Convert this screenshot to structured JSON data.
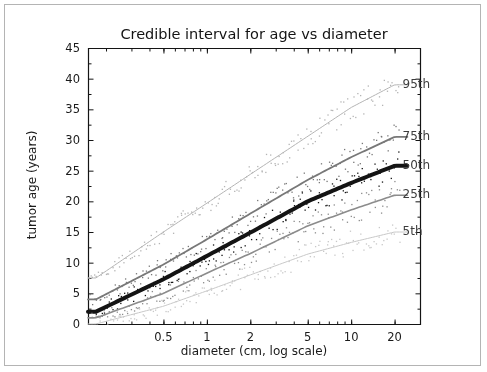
{
  "figure": {
    "title": "Credible interval for age vs diameter",
    "xlabel": "diameter (cm, log scale)",
    "ylabel": "tumor age (years)"
  },
  "chart_data": {
    "type": "line",
    "title": "Credible interval for age vs diameter",
    "xlabel": "diameter (cm, log scale)",
    "ylabel": "tumor age (years)",
    "xscale": "log",
    "yscale": "linear",
    "xlim": [
      0.15,
      30
    ],
    "ylim": [
      0,
      45
    ],
    "xticks": [
      0.5,
      1,
      2,
      5,
      10,
      20
    ],
    "xtick_labels": [
      "0.5",
      "1",
      "2",
      "5",
      "10",
      "20"
    ],
    "yticks": [
      0,
      5,
      10,
      15,
      20,
      25,
      30,
      35,
      40,
      45
    ],
    "ytick_labels": [
      "0",
      "5",
      "10",
      "15",
      "20",
      "25",
      "30",
      "35",
      "40",
      "45"
    ],
    "grid": false,
    "legend_position": "right-inline-annotations",
    "series": [
      {
        "name": "95th",
        "label": "95th",
        "color": "#b4b4b4",
        "linewidth": 1.0,
        "x": [
          0.17,
          0.5,
          1,
          2,
          5,
          10,
          20
        ],
        "values": [
          7.5,
          15.0,
          19.7,
          24.4,
          30.6,
          35.3,
          39.0
        ],
        "scatter": true
      },
      {
        "name": "75th",
        "label": "75th",
        "color": "#787878",
        "linewidth": 1.8,
        "x": [
          0.17,
          0.5,
          1,
          2,
          5,
          10,
          20
        ],
        "values": [
          4.0,
          9.7,
          13.8,
          18.0,
          23.5,
          27.2,
          30.5
        ],
        "scatter": true
      },
      {
        "name": "50th",
        "label": "50th",
        "color": "#141414",
        "linewidth": 4.0,
        "x": [
          0.17,
          0.5,
          1,
          2,
          5,
          10,
          20
        ],
        "values": [
          2.0,
          7.3,
          11.1,
          14.9,
          20.0,
          23.0,
          25.8
        ],
        "scatter": true
      },
      {
        "name": "25th",
        "label": "25th",
        "color": "#8c8c8c",
        "linewidth": 1.6,
        "x": [
          0.17,
          0.5,
          1,
          2,
          5,
          10,
          20
        ],
        "values": [
          1.0,
          5.0,
          8.3,
          11.5,
          16.0,
          18.6,
          21.0
        ],
        "scatter": true
      },
      {
        "name": "5th",
        "label": "5th",
        "color": "#c8c8c8",
        "linewidth": 1.0,
        "x": [
          0.17,
          0.5,
          1,
          2,
          5,
          10,
          20
        ],
        "values": [
          0.0,
          2.9,
          5.4,
          8.0,
          11.4,
          13.3,
          15.0
        ],
        "scatter": true
      }
    ],
    "annotations": [
      {
        "text": "95th",
        "x": 22,
        "y": 38.9
      },
      {
        "text": "75th",
        "x": 22,
        "y": 30.5
      },
      {
        "text": "50th",
        "x": 22,
        "y": 25.8
      },
      {
        "text": "25th",
        "x": 22,
        "y": 21.0
      },
      {
        "text": "5th",
        "x": 22,
        "y": 15.0
      }
    ]
  },
  "ticks": {
    "y": [
      "0",
      "5",
      "10",
      "15",
      "20",
      "25",
      "30",
      "35",
      "40",
      "45"
    ],
    "x": [
      "0.5",
      "1",
      "2",
      "5",
      "10",
      "20"
    ]
  },
  "colors": {
    "axis": "#141414",
    "frame_border": "#b4b4b4",
    "background": "#ffffff",
    "text": "#1a1a1a"
  }
}
